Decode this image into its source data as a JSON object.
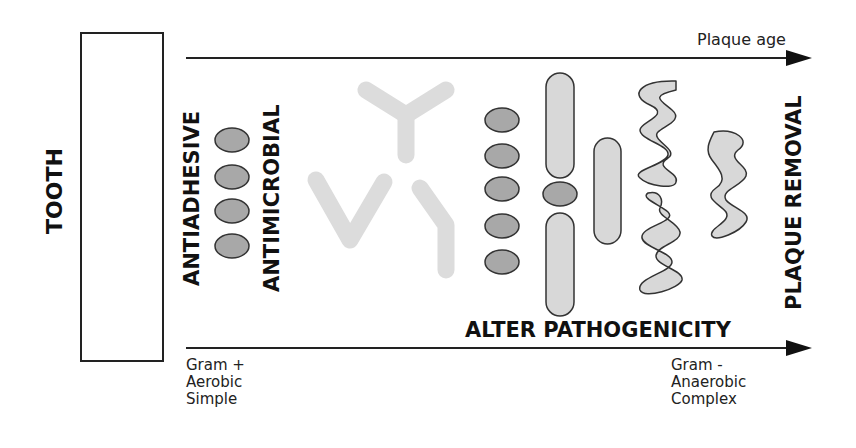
{
  "diagram": {
    "tooth_label": "TOOTH",
    "top_axis_label": "Plaque age",
    "labels": {
      "antiadhesive": "ANTIADHESIVE",
      "antimicrobial": "ANTIMICROBIAL",
      "alter_pathogenicity": "ALTER PATHOGENICITY",
      "plaque_removal": "PLAQUE REMOVAL"
    },
    "bottom_left": [
      "Gram +",
      "Aerobic",
      "Simple"
    ],
    "bottom_right": [
      "Gram -",
      "Anaerobic",
      "Complex"
    ],
    "colors": {
      "cocci_fill": "#a8a8a8",
      "rod_fill": "#d8d8d8",
      "antibody_fill": "#dcdcdc",
      "outline": "#333333"
    }
  }
}
